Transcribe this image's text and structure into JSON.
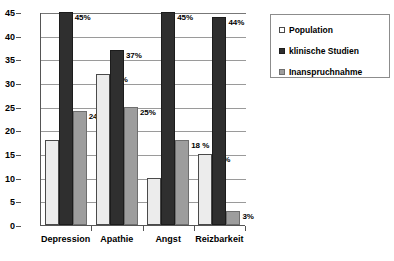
{
  "chart_data": {
    "type": "bar",
    "title": "",
    "subtitle": "",
    "xlabel": "",
    "ylabel": "",
    "categories": [
      "Depression",
      "Apathie",
      "Angst",
      "Reizbarkeit"
    ],
    "series": [
      {
        "name": "Population",
        "color": "#ececec",
        "values": [
          18,
          32,
          10,
          15
        ],
        "labels": [
          "18%",
          "32%",
          "10%",
          "15%"
        ]
      },
      {
        "name": "klinische Studien",
        "color": "#2f2f2f",
        "values": [
          45,
          37,
          45,
          44
        ],
        "labels": [
          "45%",
          "37%",
          "45%",
          "44%"
        ]
      },
      {
        "name": "Inanspruchnahme",
        "color": "#9d9d9d",
        "values": [
          24,
          25,
          18,
          3
        ],
        "labels": [
          "24%",
          "25%",
          "18 %",
          "3%"
        ]
      }
    ],
    "ylim": [
      0,
      45
    ],
    "yticks": [
      0,
      5,
      10,
      15,
      20,
      25,
      30,
      35,
      40,
      45
    ],
    "ytick_labels": [
      "0",
      "5",
      "10",
      "15",
      "20",
      "25",
      "30",
      "35",
      "40",
      "45"
    ],
    "grid": true,
    "grid_axis": "y",
    "legend_position": "top-right",
    "legend_entries": [
      "Population",
      "klinische Studien",
      "Inanspruchnahme"
    ]
  }
}
